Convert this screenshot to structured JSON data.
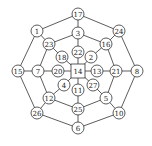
{
  "diagram": {
    "type": "graph",
    "center_node": "14",
    "nodes": [
      {
        "id": "17",
        "x": 78,
        "y": 14,
        "shape": "circle"
      },
      {
        "id": "3",
        "x": 78,
        "y": 33,
        "shape": "circle"
      },
      {
        "id": "22",
        "x": 78,
        "y": 52,
        "shape": "circle"
      },
      {
        "id": "14",
        "x": 78,
        "y": 71,
        "shape": "square"
      },
      {
        "id": "11",
        "x": 78,
        "y": 90,
        "shape": "circle"
      },
      {
        "id": "25",
        "x": 78,
        "y": 109,
        "shape": "circle"
      },
      {
        "id": "6",
        "x": 78,
        "y": 128,
        "shape": "circle"
      },
      {
        "id": "1",
        "x": 37,
        "y": 31,
        "shape": "circle"
      },
      {
        "id": "24",
        "x": 119,
        "y": 31,
        "shape": "circle"
      },
      {
        "id": "23",
        "x": 49,
        "y": 44,
        "shape": "circle"
      },
      {
        "id": "16",
        "x": 106,
        "y": 44,
        "shape": "circle"
      },
      {
        "id": "18",
        "x": 62,
        "y": 57,
        "shape": "circle"
      },
      {
        "id": "2",
        "x": 91,
        "y": 57,
        "shape": "circle"
      },
      {
        "id": "15",
        "x": 18,
        "y": 71,
        "shape": "circle"
      },
      {
        "id": "7",
        "x": 38,
        "y": 71,
        "shape": "circle"
      },
      {
        "id": "20",
        "x": 58,
        "y": 71,
        "shape": "circle"
      },
      {
        "id": "13",
        "x": 97,
        "y": 71,
        "shape": "circle"
      },
      {
        "id": "21",
        "x": 116,
        "y": 71,
        "shape": "circle"
      },
      {
        "id": "8",
        "x": 137,
        "y": 71,
        "shape": "circle"
      },
      {
        "id": "4",
        "x": 64,
        "y": 85,
        "shape": "circle"
      },
      {
        "id": "27",
        "x": 93,
        "y": 85,
        "shape": "circle"
      },
      {
        "id": "12",
        "x": 49,
        "y": 98,
        "shape": "circle"
      },
      {
        "id": "5",
        "x": 106,
        "y": 98,
        "shape": "circle"
      },
      {
        "id": "26",
        "x": 37,
        "y": 113,
        "shape": "circle"
      },
      {
        "id": "10",
        "x": 119,
        "y": 113,
        "shape": "circle"
      }
    ],
    "edges": [
      [
        "17",
        "1"
      ],
      [
        "17",
        "24"
      ],
      [
        "24",
        "8"
      ],
      [
        "8",
        "10"
      ],
      [
        "10",
        "6"
      ],
      [
        "6",
        "26"
      ],
      [
        "26",
        "15"
      ],
      [
        "15",
        "1"
      ],
      [
        "3",
        "23"
      ],
      [
        "3",
        "16"
      ],
      [
        "16",
        "21"
      ],
      [
        "21",
        "5"
      ],
      [
        "5",
        "25"
      ],
      [
        "25",
        "12"
      ],
      [
        "12",
        "7"
      ],
      [
        "7",
        "23"
      ],
      [
        "17",
        "3"
      ],
      [
        "1",
        "23"
      ],
      [
        "24",
        "16"
      ],
      [
        "8",
        "21"
      ],
      [
        "10",
        "5"
      ],
      [
        "6",
        "25"
      ],
      [
        "26",
        "12"
      ],
      [
        "15",
        "7"
      ],
      [
        "3",
        "22"
      ],
      [
        "23",
        "18"
      ],
      [
        "16",
        "2"
      ],
      [
        "21",
        "13"
      ],
      [
        "5",
        "27"
      ],
      [
        "25",
        "11"
      ],
      [
        "12",
        "4"
      ],
      [
        "7",
        "20"
      ],
      [
        "22",
        "14"
      ],
      [
        "18",
        "14"
      ],
      [
        "2",
        "14"
      ],
      [
        "13",
        "14"
      ],
      [
        "27",
        "14"
      ],
      [
        "11",
        "14"
      ],
      [
        "4",
        "14"
      ],
      [
        "20",
        "14"
      ]
    ]
  }
}
